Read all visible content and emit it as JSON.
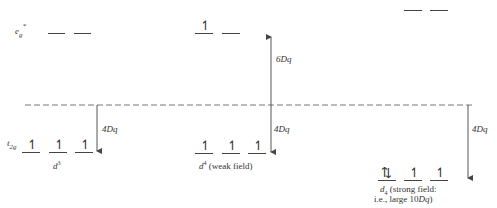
{
  "labels": {
    "eg": "e",
    "eg_sub": "g",
    "eg_sup": "*",
    "t2g": "t",
    "t2g_sub": "2g"
  },
  "energies": {
    "up_6dq": "6Dq",
    "down_4dq_1": "4Dq",
    "down_4dq_2": "4Dq",
    "down_4dq_3": "4Dq"
  },
  "configs": [
    {
      "name": "d3",
      "label_main": "d",
      "label_sup": "3",
      "eg": [
        "",
        ""
      ],
      "t2g": [
        "↿",
        "↿",
        "↿"
      ]
    },
    {
      "name": "d4-weak",
      "label_main": "d",
      "label_sup": "4",
      "label_rest": " (weak field)",
      "eg": [
        "↿",
        ""
      ],
      "t2g": [
        "↿",
        "↿",
        "↿"
      ]
    },
    {
      "name": "d4-strong",
      "label_main": "d",
      "label_sub": "4",
      "label_rest": " (strong field:",
      "label_line2": "i.e., large 10",
      "label_line2_italic": "Dq",
      "label_line2_end": ")",
      "eg": [
        "",
        ""
      ],
      "t2g": [
        "⇅",
        "↿",
        "↿"
      ]
    }
  ],
  "colors": {
    "line": "#444444",
    "dash": "#777777",
    "text": "#333333"
  }
}
